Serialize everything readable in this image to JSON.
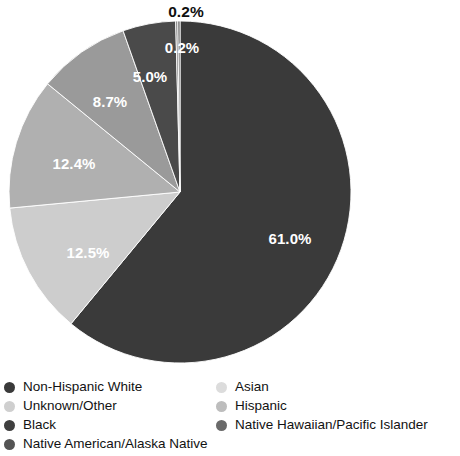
{
  "chart_data": {
    "type": "pie",
    "title": "",
    "xlabel": "",
    "ylabel": "",
    "start_angle_deg": 90,
    "direction": "clockwise",
    "legend_position": "bottom",
    "grid": false,
    "categories": [
      "Non-Hispanic White",
      "Black",
      "Hispanic",
      "Asian",
      "Unknown/Other",
      "Native American/Alaska Native",
      "Native Hawaiian/Pacific Islander"
    ],
    "values": [
      61.0,
      12.5,
      12.4,
      8.7,
      5.0,
      0.2,
      0.2
    ],
    "value_labels": [
      "61.0%",
      "12.5%",
      "12.4%",
      "8.7%",
      "5.0%",
      "0.2%",
      "0.2%"
    ],
    "colors": [
      "#3a3a3a",
      "#cdcdcd",
      "#b0b0b0",
      "#9a9a9a",
      "#4a4a4a",
      "#6e6e6e",
      "#565656"
    ],
    "slices": [
      {
        "label": "Non-Hispanic White",
        "value": 61.0,
        "text": "61.0%",
        "color": "#3a3a3a",
        "label_x": 290,
        "label_y": 238,
        "label_style": "inside"
      },
      {
        "label": "Black",
        "value": 12.5,
        "text": "12.5%",
        "color": "#cdcdcd",
        "label_x": 88,
        "label_y": 252,
        "label_style": "inside"
      },
      {
        "label": "Hispanic",
        "value": 12.4,
        "text": "12.4%",
        "color": "#b0b0b0",
        "label_x": 74,
        "label_y": 163,
        "label_style": "inside"
      },
      {
        "label": "Asian",
        "value": 8.7,
        "text": "8.7%",
        "color": "#9a9a9a",
        "label_x": 110,
        "label_y": 101,
        "label_style": "inside"
      },
      {
        "label": "Unknown/Other",
        "value": 5.0,
        "text": "5.0%",
        "color": "#4a4a4a",
        "label_x": 150,
        "label_y": 76,
        "label_style": "inside"
      },
      {
        "label": "Native American/Alaska Native",
        "value": 0.2,
        "text": "0.2%",
        "color": "#6e6e6e",
        "label_x": 182,
        "label_y": 47,
        "label_style": "inside"
      },
      {
        "label": "Native Hawaiian/Pacific Islander",
        "value": 0.2,
        "text": "0.2%",
        "color": "#565656",
        "label_x": 186,
        "label_y": 12,
        "label_style": "outside"
      }
    ]
  },
  "legend": {
    "columns": [
      {
        "items": [
          {
            "label": "Non-Hispanic White",
            "color": "#3a3a3a"
          },
          {
            "label": "Unknown/Other",
            "color": "#cfcfcf"
          },
          {
            "label": "Black",
            "color": "#3f3f3f"
          },
          {
            "label": "Native American/Alaska Native",
            "color": "#545454"
          }
        ]
      },
      {
        "items": [
          {
            "label": "Asian",
            "color": "#dcdcdc"
          },
          {
            "label": "Hispanic",
            "color": "#bdbdbd"
          },
          {
            "label": "Native Hawaiian/Pacific Islander",
            "color": "#6a6a6a"
          }
        ]
      }
    ]
  }
}
